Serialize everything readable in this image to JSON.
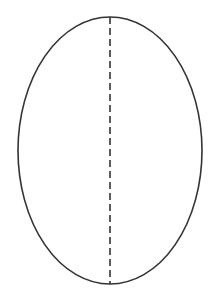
{
  "diagram": {
    "type": "ellipse-with-axis",
    "shape": {
      "cx": 110,
      "cy": 150.5,
      "rx": 92,
      "ry": 133.5,
      "stroke": "#333333",
      "stroke_width": 1.6,
      "fill": "#ffffff"
    },
    "axis": {
      "x": 110,
      "y1": 17,
      "y2": 284,
      "stroke": "#333333",
      "dash": "7 4",
      "style": "dashed"
    }
  }
}
